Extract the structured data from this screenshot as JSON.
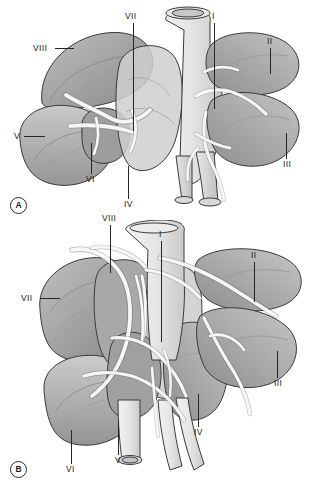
{
  "figure": {
    "background_color": "#ffffff",
    "width": 313,
    "height": 486
  },
  "palette": {
    "lobe_dark": "#8d8d8d",
    "lobe_mid": "#a5a5a5",
    "lobe_light": "#bdbdbd",
    "lobe_pale": "#d2d2d2",
    "airway_fill": "#e2e2e2",
    "airway_light": "#ededed",
    "outline": "#3a3a3a",
    "label_color": "#1a1a1a",
    "leader_color": "#262626"
  },
  "panels": [
    {
      "id": "A",
      "marker": "A",
      "labels": [
        {
          "name": "label-a-viii",
          "text": "VIII",
          "x": 33,
          "y": 44,
          "leader": {
            "type": "h",
            "x": 55,
            "y": 48,
            "len": 19
          }
        },
        {
          "name": "label-a-vii",
          "text": "VII",
          "x": 125,
          "y": 12,
          "leader": {
            "type": "v",
            "x": 133,
            "y": 23,
            "len": 108
          }
        },
        {
          "name": "label-a-i",
          "text": "I",
          "x": 212,
          "y": 12,
          "leader": {
            "type": "v",
            "x": 214,
            "y": 23,
            "len": 86
          }
        },
        {
          "name": "label-a-ii",
          "text": "II",
          "x": 267,
          "y": 37,
          "leader": {
            "type": "v",
            "x": 270,
            "y": 48,
            "len": 26
          }
        },
        {
          "name": "label-a-iii",
          "text": "III",
          "x": 283,
          "y": 160,
          "leader": {
            "type": "v",
            "x": 286,
            "y": 133,
            "len": 26
          }
        },
        {
          "name": "label-a-v",
          "text": "V",
          "x": 14,
          "y": 132,
          "leader": {
            "type": "h",
            "x": 24,
            "y": 136,
            "len": 21
          }
        },
        {
          "name": "label-a-vi",
          "text": "VI",
          "x": 86,
          "y": 175,
          "leader": {
            "type": "v",
            "x": 91,
            "y": 143,
            "len": 31
          }
        },
        {
          "name": "label-a-iv",
          "text": "IV",
          "x": 124,
          "y": 200,
          "leader": {
            "type": "v",
            "x": 128,
            "y": 166,
            "len": 33
          }
        }
      ]
    },
    {
      "id": "B",
      "marker": "B",
      "labels": [
        {
          "name": "label-b-viii",
          "text": "VIII",
          "x": 102,
          "y": 214,
          "leader": {
            "type": "v",
            "x": 110,
            "y": 225,
            "len": 48
          }
        },
        {
          "name": "label-b-i",
          "text": "I",
          "x": 159,
          "y": 230,
          "leader": {
            "type": "v",
            "x": 161,
            "y": 241,
            "len": 101
          }
        },
        {
          "name": "label-b-ii",
          "text": "II",
          "x": 251,
          "y": 251,
          "leader": {
            "type": "v",
            "x": 254,
            "y": 262,
            "len": 40
          }
        },
        {
          "name": "label-b-vii",
          "text": "VII",
          "x": 21,
          "y": 294,
          "leader": {
            "type": "h",
            "x": 40,
            "y": 298,
            "len": 20
          }
        },
        {
          "name": "label-b-iii",
          "text": "III",
          "x": 274,
          "y": 379,
          "leader": {
            "type": "v",
            "x": 277,
            "y": 351,
            "len": 27
          }
        },
        {
          "name": "label-b-iv",
          "text": "IV",
          "x": 194,
          "y": 428,
          "leader": {
            "type": "v",
            "x": 198,
            "y": 394,
            "len": 33
          }
        },
        {
          "name": "label-b-v",
          "text": "V",
          "x": 115,
          "y": 456,
          "leader": {
            "type": "v",
            "x": 118,
            "y": 420,
            "len": 35
          }
        },
        {
          "name": "label-b-vi",
          "text": "VI",
          "x": 66,
          "y": 465,
          "leader": {
            "type": "v",
            "x": 71,
            "y": 430,
            "len": 34
          }
        }
      ]
    }
  ]
}
